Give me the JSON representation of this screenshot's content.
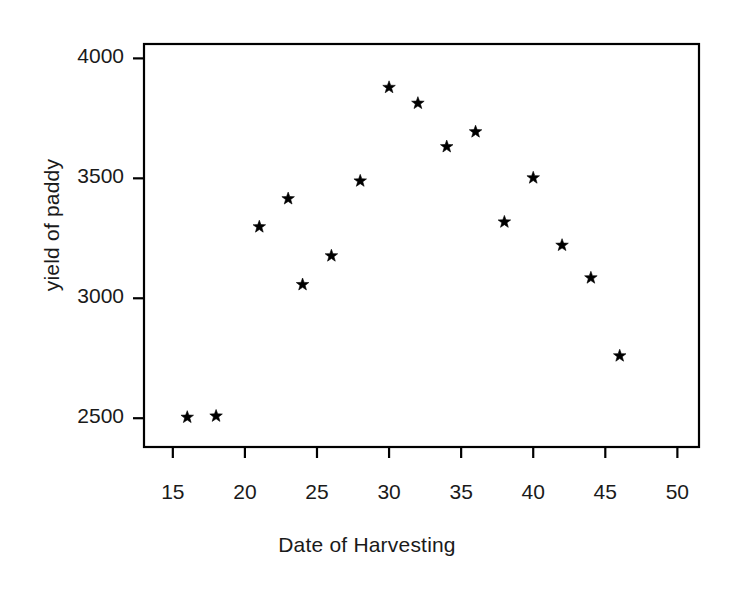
{
  "chart_data": {
    "type": "scatter",
    "title": "",
    "xlabel": "Date of Harvesting",
    "ylabel": "yield of paddy",
    "xlim": [
      13,
      51.5
    ],
    "ylim": [
      2380,
      4060
    ],
    "xticks": [
      15,
      20,
      25,
      30,
      35,
      40,
      45,
      50
    ],
    "xticklabels": [
      "15",
      "20",
      "25",
      "30",
      "35",
      "40",
      "45",
      "50"
    ],
    "yticks": [
      2500,
      3000,
      3500,
      4000
    ],
    "yticklabels": [
      "2500",
      "3000",
      "3500",
      "4000"
    ],
    "grid": false,
    "legend": null,
    "marker": "star",
    "marker_color": "#000000",
    "frame_color": "#000000",
    "x": [
      16,
      18,
      21,
      23,
      24,
      26,
      28,
      30,
      32,
      34,
      36,
      38,
      40,
      42,
      44,
      46
    ],
    "y": [
      2504,
      2509,
      3298,
      3415,
      3057,
      3177,
      3489,
      3879,
      3813,
      3632,
      3694,
      3318,
      3502,
      3221,
      3085,
      2760
    ],
    "points": [
      {
        "x": 16,
        "y": 2504
      },
      {
        "x": 18,
        "y": 2509
      },
      {
        "x": 21,
        "y": 3298
      },
      {
        "x": 23,
        "y": 3415
      },
      {
        "x": 24,
        "y": 3057
      },
      {
        "x": 26,
        "y": 3177
      },
      {
        "x": 28,
        "y": 3489
      },
      {
        "x": 30,
        "y": 3879
      },
      {
        "x": 32,
        "y": 3813
      },
      {
        "x": 34,
        "y": 3632
      },
      {
        "x": 36,
        "y": 3694
      },
      {
        "x": 38,
        "y": 3318
      },
      {
        "x": 40,
        "y": 3502
      },
      {
        "x": 42,
        "y": 3221
      },
      {
        "x": 44,
        "y": 3085
      },
      {
        "x": 46,
        "y": 2760
      }
    ]
  }
}
